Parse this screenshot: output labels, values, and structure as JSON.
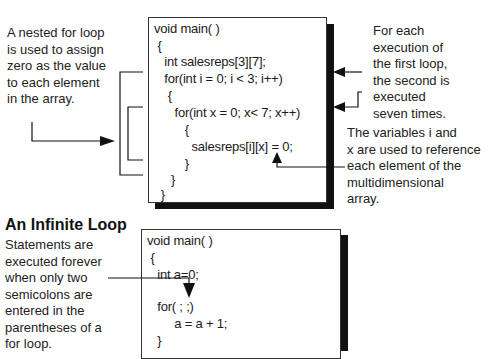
{
  "annotations": {
    "nested_loop_note": "A nested for loop\nis used to assign\nzero as the value\nto each element\nin the array.",
    "each_execution_note": "For each\nexecution of\nthe first loop,\nthe second is\nexecuted\nseven times.",
    "variables_note": "The variables i and\nx are used to reference\neach element of the\nmultidimensional\narray.",
    "infinite_heading": "An Infinite Loop",
    "infinite_note": "Statements are\nexecuted forever\nwhen only two\nsemicolons are\nentered in the\nparentheses of a\nfor loop."
  },
  "code_top": {
    "lines": [
      "void main( )",
      " {",
      "   int salesreps[3][7];",
      "   for(int i = 0; i < 3; i++)",
      "    {",
      "      for(int x = 0; x< 7; x++)",
      "         {",
      "           salesreps[i][x] = 0;",
      "         }",
      "     }",
      "  }"
    ]
  },
  "code_bottom": {
    "lines": [
      "void main( )",
      " {",
      "   int a=0;",
      "",
      "   for( ; ;)",
      "        a = a + 1;",
      "   }"
    ]
  },
  "colors": {
    "line": "#111111",
    "border": "#333333",
    "text": "#1a1a1a"
  }
}
